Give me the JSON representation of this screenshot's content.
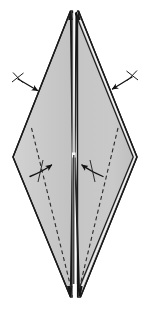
{
  "figure": {
    "title": "Origami diagram: diamond base with inward folds",
    "caption": "",
    "background_color": "#ffffff",
    "paper": {
      "fill_color": "#c9c9c9",
      "fill_color_left": "#c9c9c9",
      "fill_color_right": "#c4c4c4",
      "edge_color": "#1a1a1a",
      "edge_width": 1.4,
      "highlight_color": "#e8e8e8"
    },
    "spine": {
      "name": "center-spine",
      "color": "#151515",
      "notch_color": "#f2f2f2",
      "top_y": 11,
      "bottom_y": 298,
      "notch_y": 155
    },
    "fold_lines": {
      "style": "dashed",
      "color": "#2b2b2b",
      "dash_pattern": "4 3",
      "width": 1.1,
      "count": 2,
      "label": "valley fold"
    },
    "curved_arrows": {
      "color": "#111111",
      "count": 2,
      "left_direction": "right",
      "right_direction": "left",
      "label": "fold inward"
    },
    "straight_arrows": {
      "color": "#111111",
      "count": 2,
      "has_crosshatch_tail": true,
      "label": "fold edge to center"
    },
    "geometry": {
      "apex_left_x": 70,
      "apex_right_x": 78,
      "apex_y": 11,
      "vertex_left_x": 13,
      "vertex_left_y": 157,
      "vertex_right_x": 137,
      "vertex_right_y": 157,
      "tip_left_x": 70,
      "tip_right_x": 80,
      "tip_y": 298
    }
  }
}
